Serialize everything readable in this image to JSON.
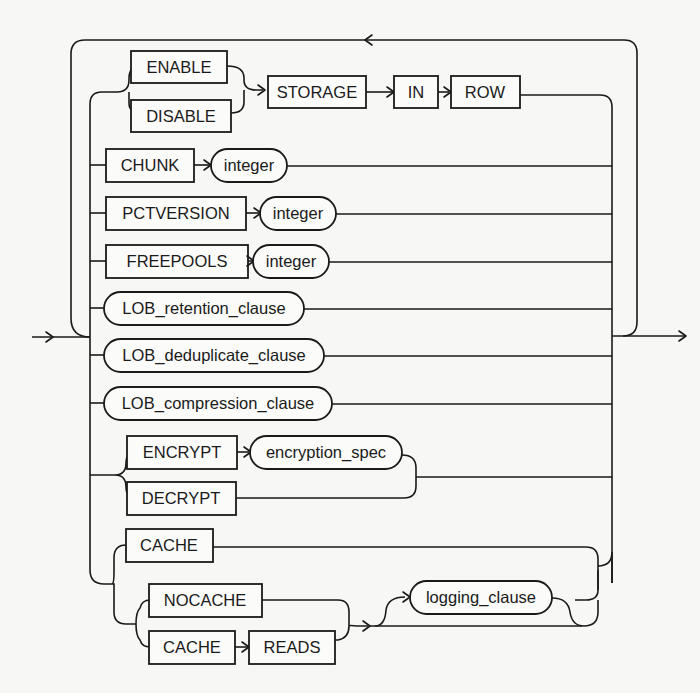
{
  "diagram": {
    "type": "railroad-syntax-diagram",
    "colors": {
      "ink": "#1a1a1a",
      "background": "#f7f7f5"
    },
    "keywords": {
      "enable": "ENABLE",
      "disable": "DISABLE",
      "storage": "STORAGE",
      "in": "IN",
      "row": "ROW",
      "chunk": "CHUNK",
      "pctversion": "PCTVERSION",
      "freepools": "FREEPOOLS",
      "encrypt": "ENCRYPT",
      "decrypt": "DECRYPT",
      "cache": "CACHE",
      "nocache": "NOCACHE",
      "cache_reads_cache": "CACHE",
      "reads": "READS"
    },
    "nonterminals": {
      "chunk_integer": "integer",
      "pctversion_integer": "integer",
      "freepools_integer": "integer",
      "lob_retention": "LOB_retention_clause",
      "lob_deduplicate": "LOB_deduplicate_clause",
      "lob_compression": "LOB_compression_clause",
      "encryption_spec": "encryption_spec",
      "logging_clause": "logging_clause"
    },
    "branches": [
      {
        "items": [
          "ENABLE | DISABLE",
          "STORAGE",
          "IN",
          "ROW"
        ]
      },
      {
        "items": [
          "CHUNK",
          "integer"
        ]
      },
      {
        "items": [
          "PCTVERSION",
          "integer"
        ]
      },
      {
        "items": [
          "FREEPOOLS",
          "integer"
        ]
      },
      {
        "items": [
          "LOB_retention_clause"
        ]
      },
      {
        "items": [
          "LOB_deduplicate_clause"
        ]
      },
      {
        "items": [
          "LOB_compression_clause"
        ]
      },
      {
        "items": [
          "ENCRYPT encryption_spec | DECRYPT"
        ]
      },
      {
        "items": [
          "CACHE | (NOCACHE | CACHE READS) [logging_clause]"
        ]
      }
    ],
    "repeat_loop": true
  }
}
